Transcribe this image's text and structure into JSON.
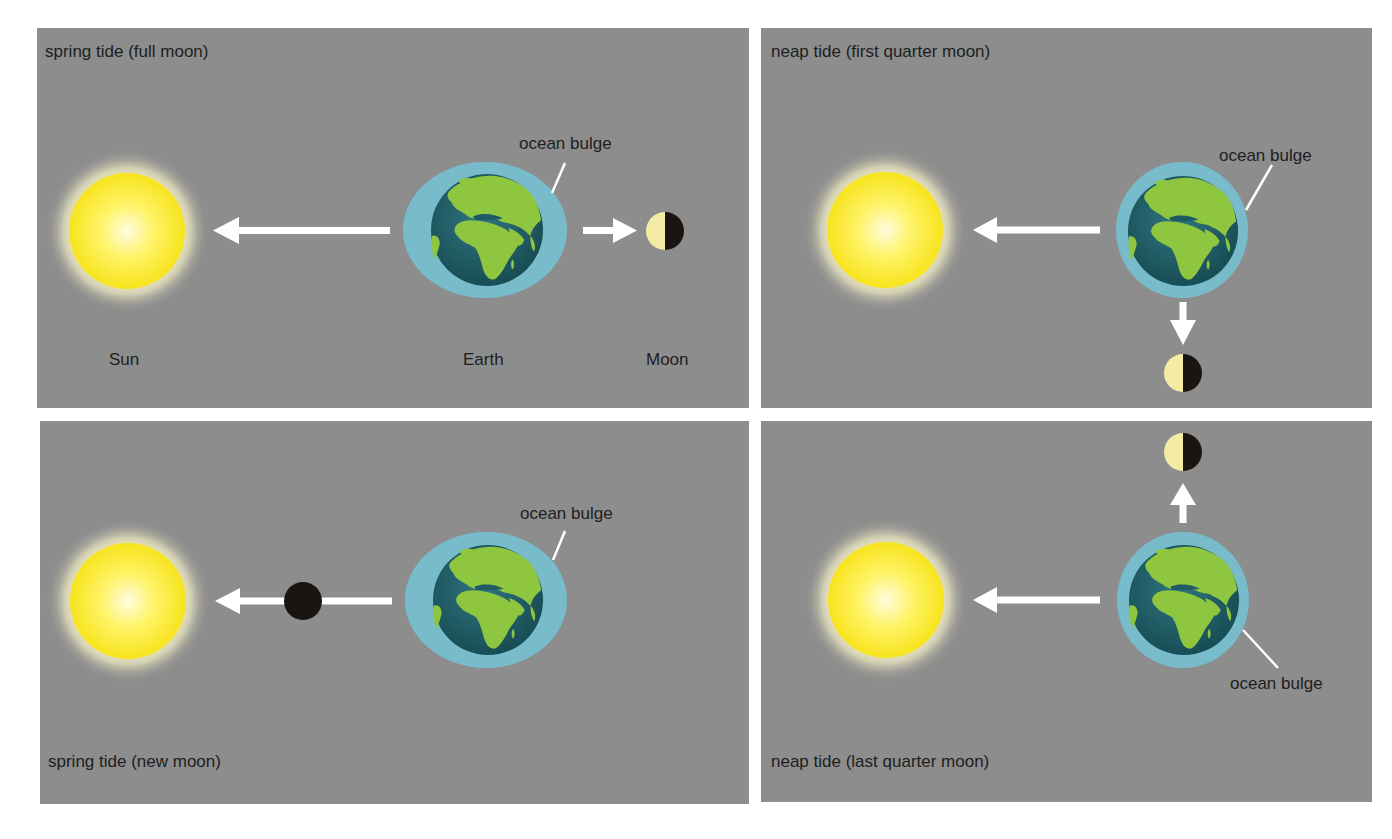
{
  "colors": {
    "panel_bg": "#8d8d8d",
    "sun_core": "#fffbe0",
    "sun_mid": "#fff46a",
    "sun_edge": "#f5e21a",
    "sun_glow": "#fffad0",
    "ocean_bulge": "#78bccb",
    "earth_ocean": "#1e5b64",
    "earth_land": "#8fc640",
    "moon_light": "#f4eca3",
    "moon_dark": "#1a1511",
    "arrow": "#ffffff",
    "text": "#1e1e1e"
  },
  "panels": [
    {
      "id": "spring-full",
      "title": "spring tide (full moon)",
      "moon_phase": "full",
      "moon_position": "beyond-earth",
      "ocean_bulge_label": "ocean bulge",
      "body_labels": {
        "sun": "Sun",
        "earth": "Earth",
        "moon": "Moon"
      }
    },
    {
      "id": "neap-first",
      "title": "neap tide (first quarter moon)",
      "moon_phase": "first quarter",
      "moon_position": "below-earth",
      "ocean_bulge_label": "ocean bulge"
    },
    {
      "id": "spring-new",
      "title": "spring tide (new moon)",
      "moon_phase": "new",
      "moon_position": "between-sun-earth",
      "ocean_bulge_label": "ocean bulge"
    },
    {
      "id": "neap-last",
      "title": "neap tide (last quarter moon)",
      "moon_phase": "last quarter",
      "moon_position": "above-earth",
      "ocean_bulge_label": "ocean bulge"
    }
  ]
}
